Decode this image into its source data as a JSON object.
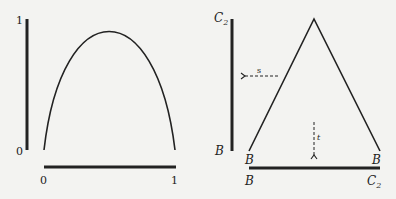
{
  "left_panel": {
    "y_axis": {
      "top_label": "1",
      "bottom_label": "0"
    },
    "x_axis": {
      "left_label": "0",
      "right_label": "1"
    },
    "curve": "parabola (inverted, peak at x≈0.5, y=1)"
  },
  "right_panel": {
    "y_axis": {
      "top_label": "C",
      "top_sub": "2",
      "bottom_label": "B"
    },
    "x_axis": {
      "left_label": "B",
      "right_label": "C",
      "right_sub": "2"
    },
    "triangle": {
      "left_vertex_label": "B",
      "right_vertex_label": "B"
    },
    "arrows": {
      "horizontal": {
        "label": "s",
        "direction": "left"
      },
      "vertical": {
        "label": "t",
        "direction": "down"
      }
    }
  },
  "colors": {
    "stroke": "#222222",
    "background": "#f3f3f1"
  }
}
